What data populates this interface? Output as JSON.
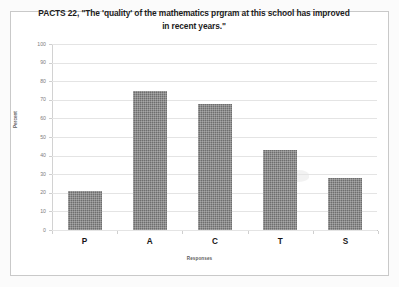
{
  "chart_data": {
    "type": "bar",
    "title": "PACTS 22, \"The 'quality' of the mathematics prgram at this school has improved in recent years.\"",
    "xlabel": "Responses",
    "ylabel": "Percent",
    "categories": [
      "P",
      "A",
      "C",
      "T",
      "S"
    ],
    "values": [
      21,
      75,
      68,
      43,
      28
    ],
    "ylim": [
      0,
      100
    ],
    "yticks": [
      0,
      10,
      20,
      30,
      40,
      50,
      60,
      70,
      80,
      90,
      100
    ],
    "ytick_labels": [
      "0",
      "10",
      "20",
      "30",
      "40",
      "50",
      "60",
      "70",
      "80",
      "90",
      "100"
    ],
    "grid": true,
    "legend": false,
    "bar_color": "#6e6e6e",
    "gridline_color": "#e4e4e4",
    "plot_background": "#ffffff",
    "border_color": "#c9c9c9"
  }
}
